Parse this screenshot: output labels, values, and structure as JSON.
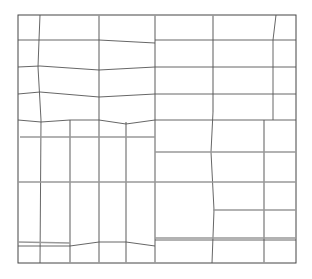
{
  "diagram": {
    "title": "",
    "type": "grid-layout-line-drawing",
    "colors": {
      "background": "#ffffff",
      "line_dark": "#555555",
      "line_light": "#999999"
    },
    "outer_box": {
      "x1": 18,
      "y1": 15,
      "x2": 296,
      "y2": 263
    },
    "lines": [
      {
        "x1": 40,
        "y1": 15,
        "x2": 39,
        "y2": 40,
        "w": "thin"
      },
      {
        "x1": 39,
        "y1": 40,
        "x2": 38,
        "y2": 67,
        "w": "thin"
      },
      {
        "x1": 38,
        "y1": 67,
        "x2": 41,
        "y2": 120,
        "w": "thin"
      },
      {
        "x1": 41,
        "y1": 120,
        "x2": 40,
        "y2": 263,
        "w": "thin"
      },
      {
        "x1": 99,
        "y1": 15,
        "x2": 99,
        "y2": 263,
        "w": "thick"
      },
      {
        "x1": 155,
        "y1": 15,
        "x2": 155,
        "y2": 263,
        "w": "thick"
      },
      {
        "x1": 213,
        "y1": 15,
        "x2": 213,
        "y2": 112,
        "w": "thick"
      },
      {
        "x1": 213,
        "y1": 112,
        "x2": 211,
        "y2": 152,
        "w": "thin"
      },
      {
        "x1": 211,
        "y1": 152,
        "x2": 214,
        "y2": 210,
        "w": "thin"
      },
      {
        "x1": 214,
        "y1": 210,
        "x2": 212,
        "y2": 263,
        "w": "thin"
      },
      {
        "x1": 276,
        "y1": 15,
        "x2": 273,
        "y2": 40,
        "w": "thin"
      },
      {
        "x1": 273,
        "y1": 40,
        "x2": 273,
        "y2": 120,
        "w": "thin"
      },
      {
        "x1": 264,
        "y1": 120,
        "x2": 264,
        "y2": 263,
        "w": "thick"
      },
      {
        "x1": 70,
        "y1": 120,
        "x2": 70,
        "y2": 263,
        "w": "thick"
      },
      {
        "x1": 126,
        "y1": 122,
        "x2": 126,
        "y2": 263,
        "w": "thick"
      },
      {
        "x1": 18,
        "y1": 40,
        "x2": 99,
        "y2": 40,
        "w": "thin"
      },
      {
        "x1": 99,
        "y1": 40,
        "x2": 155,
        "y2": 43,
        "w": "thin"
      },
      {
        "x1": 155,
        "y1": 40,
        "x2": 296,
        "y2": 40,
        "w": "thin"
      },
      {
        "x1": 18,
        "y1": 67,
        "x2": 40,
        "y2": 66,
        "w": "thin"
      },
      {
        "x1": 40,
        "y1": 66,
        "x2": 99,
        "y2": 70,
        "w": "thin"
      },
      {
        "x1": 99,
        "y1": 70,
        "x2": 155,
        "y2": 67,
        "w": "thin"
      },
      {
        "x1": 155,
        "y1": 67,
        "x2": 296,
        "y2": 67,
        "w": "thin"
      },
      {
        "x1": 18,
        "y1": 94,
        "x2": 40,
        "y2": 92,
        "w": "thin"
      },
      {
        "x1": 40,
        "y1": 92,
        "x2": 99,
        "y2": 97,
        "w": "thin"
      },
      {
        "x1": 99,
        "y1": 97,
        "x2": 155,
        "y2": 94,
        "w": "thin"
      },
      {
        "x1": 155,
        "y1": 94,
        "x2": 296,
        "y2": 94,
        "w": "thin"
      },
      {
        "x1": 18,
        "y1": 120,
        "x2": 41,
        "y2": 122,
        "w": "thin"
      },
      {
        "x1": 41,
        "y1": 122,
        "x2": 70,
        "y2": 120,
        "w": "thin"
      },
      {
        "x1": 70,
        "y1": 120,
        "x2": 99,
        "y2": 120,
        "w": "thin"
      },
      {
        "x1": 99,
        "y1": 120,
        "x2": 126,
        "y2": 124,
        "w": "thin"
      },
      {
        "x1": 126,
        "y1": 124,
        "x2": 155,
        "y2": 120,
        "w": "thin"
      },
      {
        "x1": 155,
        "y1": 120,
        "x2": 296,
        "y2": 120,
        "w": "thin"
      },
      {
        "x1": 20,
        "y1": 137,
        "x2": 155,
        "y2": 137,
        "w": "thick"
      },
      {
        "x1": 155,
        "y1": 152,
        "x2": 296,
        "y2": 152,
        "w": "thick"
      },
      {
        "x1": 18,
        "y1": 182,
        "x2": 296,
        "y2": 182,
        "w": "thick"
      },
      {
        "x1": 213,
        "y1": 210,
        "x2": 296,
        "y2": 210,
        "w": "thick"
      },
      {
        "x1": 155,
        "y1": 238,
        "x2": 296,
        "y2": 238,
        "w": "thick"
      },
      {
        "x1": 18,
        "y1": 246,
        "x2": 70,
        "y2": 246,
        "w": "thin"
      },
      {
        "x1": 70,
        "y1": 246,
        "x2": 99,
        "y2": 242,
        "w": "thin"
      },
      {
        "x1": 99,
        "y1": 242,
        "x2": 126,
        "y2": 242,
        "w": "thin"
      },
      {
        "x1": 126,
        "y1": 242,
        "x2": 155,
        "y2": 246,
        "w": "thin"
      },
      {
        "x1": 18,
        "y1": 242,
        "x2": 70,
        "y2": 243,
        "w": "thick"
      },
      {
        "x1": 155,
        "y1": 240,
        "x2": 296,
        "y2": 240,
        "w": "thin"
      }
    ]
  }
}
